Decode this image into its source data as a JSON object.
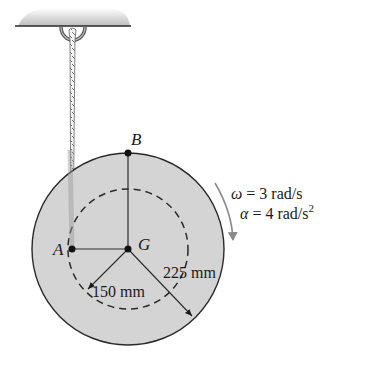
{
  "figure": {
    "points": {
      "A": "A",
      "B": "B",
      "G": "G"
    },
    "dimensions": {
      "inner_radius": "150 mm",
      "outer_radius": "225 mm"
    },
    "kinematics": {
      "omega_symbol": "ω",
      "omega_value": " = 3 rad/s",
      "alpha_symbol": "α",
      "alpha_value": " = 4 rad/s",
      "alpha_exponent": "2"
    },
    "colors": {
      "disk_fill": "#d4d4d4",
      "outline": "#2a2a2a",
      "arrow_gray": "#8a8a8a",
      "ceiling_shade": "#c8c8c8"
    }
  }
}
